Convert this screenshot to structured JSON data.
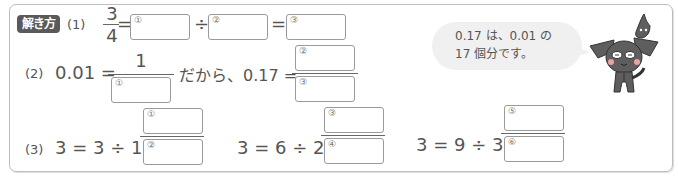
{
  "badge": "解き方",
  "problems": {
    "p1": {
      "label": "(1)",
      "frac_num": "3",
      "frac_den": "4",
      "eq1": "=",
      "div": "÷",
      "eq2": "=",
      "boxes": [
        "①",
        "②",
        "③"
      ]
    },
    "p2": {
      "label": "(2)",
      "lhs": "0.01 =",
      "frac_num": "1",
      "box_den": "①",
      "middle": "だから、0.17 =",
      "box_num": "②",
      "box_den2": "③"
    },
    "p3": {
      "label": "(3)",
      "expr1": "3 = 3 ÷ 1 =",
      "expr2": "3 = 6 ÷ 2 =",
      "expr3": "3 = 9 ÷ 3 =",
      "boxes": [
        "①",
        "②",
        "③",
        "④",
        "⑤",
        "⑥"
      ]
    }
  },
  "hint": {
    "line1": "0.17 は、0.01 の",
    "line2": "17 個分です。"
  },
  "mascot": "dog-character-icon"
}
